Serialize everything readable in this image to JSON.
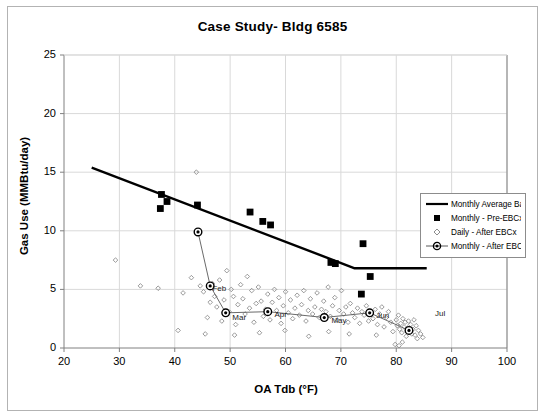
{
  "chart_data": {
    "type": "scatter",
    "title": "Case Study- Bldg 6585",
    "xlabel": "OA Tdb (°F)",
    "ylabel": "Gas Use (MMBtu/day)",
    "xlim": [
      20,
      100
    ],
    "ylim": [
      0,
      25
    ],
    "xticks": [
      20,
      30,
      40,
      50,
      60,
      70,
      80,
      90,
      100
    ],
    "yticks": [
      0,
      5,
      10,
      15,
      20,
      25
    ],
    "grid": "both-light",
    "legend_position": "right-middle",
    "series": [
      {
        "name": "Monthly Average Baseline",
        "type": "line",
        "marker": "none",
        "color": "#000000",
        "points": [
          [
            25.0,
            15.4
          ],
          [
            72.5,
            6.8
          ],
          [
            85.5,
            6.8
          ]
        ]
      },
      {
        "name": "Monthly - Pre-EBCx",
        "type": "scatter",
        "marker": "filled-square",
        "color": "#000000",
        "points": [
          [
            37.6,
            13.1
          ],
          [
            38.6,
            12.5
          ],
          [
            37.4,
            11.9
          ],
          [
            44.1,
            12.2
          ],
          [
            53.6,
            11.6
          ],
          [
            55.9,
            10.8
          ],
          [
            57.3,
            10.5
          ],
          [
            68.2,
            7.3
          ],
          [
            69.0,
            7.2
          ],
          [
            74.0,
            8.9
          ],
          [
            75.3,
            6.1
          ],
          [
            73.7,
            4.6
          ]
        ]
      },
      {
        "name": "Daily - After EBCx",
        "type": "scatter",
        "marker": "open-diamond",
        "color": "#808080",
        "points": [
          [
            29.3,
            7.5
          ],
          [
            33.8,
            5.3
          ],
          [
            37.0,
            5.1
          ],
          [
            40.6,
            1.5
          ],
          [
            41.5,
            4.7
          ],
          [
            43.9,
            15.0
          ],
          [
            44.2,
            9.9
          ],
          [
            43.0,
            6.0
          ],
          [
            44.6,
            5.3
          ],
          [
            45.2,
            4.8
          ],
          [
            45.9,
            2.6
          ],
          [
            46.4,
            3.9
          ],
          [
            46.8,
            5.5
          ],
          [
            47.2,
            4.4
          ],
          [
            47.6,
            3.5
          ],
          [
            48.1,
            5.8
          ],
          [
            48.5,
            2.3
          ],
          [
            48.9,
            4.1
          ],
          [
            49.4,
            6.6
          ],
          [
            49.8,
            3.1
          ],
          [
            50.2,
            5.0
          ],
          [
            50.6,
            4.4
          ],
          [
            51.0,
            2.0
          ],
          [
            51.4,
            3.7
          ],
          [
            51.9,
            5.4
          ],
          [
            52.3,
            4.2
          ],
          [
            52.7,
            2.9
          ],
          [
            53.1,
            6.1
          ],
          [
            53.5,
            3.4
          ],
          [
            53.9,
            4.9
          ],
          [
            54.3,
            2.2
          ],
          [
            54.7,
            3.8
          ],
          [
            55.1,
            5.2
          ],
          [
            55.6,
            4.0
          ],
          [
            56.0,
            2.7
          ],
          [
            56.4,
            3.3
          ],
          [
            56.8,
            4.6
          ],
          [
            57.2,
            2.4
          ],
          [
            57.6,
            3.9
          ],
          [
            58.0,
            5.0
          ],
          [
            58.4,
            3.2
          ],
          [
            58.8,
            4.3
          ],
          [
            59.2,
            2.1
          ],
          [
            59.6,
            3.6
          ],
          [
            60.0,
            4.8
          ],
          [
            60.5,
            3.0
          ],
          [
            60.9,
            4.1
          ],
          [
            61.3,
            2.5
          ],
          [
            61.7,
            3.4
          ],
          [
            62.1,
            4.5
          ],
          [
            62.5,
            2.8
          ],
          [
            62.9,
            3.7
          ],
          [
            63.3,
            4.9
          ],
          [
            63.7,
            2.3
          ],
          [
            64.1,
            3.2
          ],
          [
            64.5,
            4.2
          ],
          [
            64.9,
            2.9
          ],
          [
            65.3,
            3.5
          ],
          [
            65.7,
            4.7
          ],
          [
            66.1,
            2.6
          ],
          [
            66.5,
            3.3
          ],
          [
            66.9,
            4.0
          ],
          [
            67.3,
            3.1
          ],
          [
            67.7,
            5.2
          ],
          [
            68.1,
            2.7
          ],
          [
            68.5,
            3.6
          ],
          [
            68.9,
            4.3
          ],
          [
            69.3,
            2.4
          ],
          [
            69.7,
            3.2
          ],
          [
            70.1,
            4.9
          ],
          [
            70.5,
            2.9
          ],
          [
            70.9,
            3.5
          ],
          [
            71.3,
            2.2
          ],
          [
            71.7,
            3.8
          ],
          [
            72.1,
            3.0
          ],
          [
            72.5,
            2.6
          ],
          [
            73.0,
            3.4
          ],
          [
            73.4,
            2.1
          ],
          [
            73.8,
            3.1
          ],
          [
            74.2,
            2.8
          ],
          [
            74.6,
            3.6
          ],
          [
            75.0,
            2.3
          ],
          [
            75.4,
            3.0
          ],
          [
            75.8,
            2.5
          ],
          [
            76.2,
            3.3
          ],
          [
            76.6,
            2.0
          ],
          [
            77.0,
            2.9
          ],
          [
            77.4,
            3.5
          ],
          [
            77.8,
            1.8
          ],
          [
            78.2,
            2.6
          ],
          [
            78.6,
            3.1
          ],
          [
            79.0,
            2.2
          ],
          [
            79.4,
            1.4
          ],
          [
            79.8,
            0.3
          ],
          [
            80.0,
            2.4
          ],
          [
            80.2,
            1.9
          ],
          [
            80.4,
            2.8
          ],
          [
            80.6,
            1.6
          ],
          [
            80.8,
            2.1
          ],
          [
            81.0,
            1.3
          ],
          [
            81.2,
            2.5
          ],
          [
            81.4,
            1.8
          ],
          [
            81.6,
            2.2
          ],
          [
            81.8,
            1.0
          ],
          [
            82.0,
            1.7
          ],
          [
            82.2,
            2.3
          ],
          [
            82.4,
            1.4
          ],
          [
            82.6,
            2.0
          ],
          [
            82.8,
            1.2
          ],
          [
            83.0,
            1.6
          ],
          [
            83.2,
            2.4
          ],
          [
            83.4,
            1.1
          ],
          [
            83.6,
            1.9
          ],
          [
            83.8,
            0.8
          ],
          [
            84.0,
            1.5
          ],
          [
            84.4,
            1.2
          ],
          [
            84.8,
            0.9
          ],
          [
            80.5,
            0.2
          ],
          [
            81.1,
            0.5
          ],
          [
            45.5,
            1.2
          ],
          [
            50.8,
            1.1
          ],
          [
            55.3,
            1.3
          ],
          [
            59.9,
            1.5
          ],
          [
            64.2,
            1.0
          ],
          [
            67.8,
            1.4
          ],
          [
            71.5,
            1.2
          ],
          [
            76.4,
            1.1
          ]
        ]
      },
      {
        "name": "Monthly - After EBCx",
        "type": "line-marker",
        "marker": "bullseye-circle",
        "color": "#595959",
        "points": [
          [
            44.2,
            9.9
          ],
          [
            46.4,
            5.3
          ],
          [
            49.2,
            3.0
          ],
          [
            56.8,
            3.1
          ],
          [
            67.0,
            2.6
          ],
          [
            75.2,
            3.0
          ],
          [
            82.3,
            1.5
          ]
        ],
        "point_labels": [
          "",
          "Feb",
          "Mar",
          "Apr",
          "May",
          "Jun",
          "Jul"
        ]
      }
    ],
    "annotations": [
      {
        "text": "Feb",
        "x": 46.8,
        "y": 5.0
      },
      {
        "text": "Mar",
        "x": 50.4,
        "y": 2.6
      },
      {
        "text": "Apr",
        "x": 58.0,
        "y": 2.8
      },
      {
        "text": "May",
        "x": 68.3,
        "y": 2.3
      },
      {
        "text": "Jun",
        "x": 76.4,
        "y": 2.7
      },
      {
        "text": "Jul",
        "x": 87.0,
        "y": 2.9
      }
    ]
  },
  "legend": {
    "items": [
      {
        "label": "Monthly Average Baseline",
        "key": "line"
      },
      {
        "label": "Monthly - Pre-EBCx",
        "key": "filled-square"
      },
      {
        "label": "Daily - After EBCx",
        "key": "open-diamond"
      },
      {
        "label": "Monthly - After EBCx",
        "key": "line-bullseye"
      }
    ]
  },
  "colors": {
    "axis": "#808080",
    "grid": "#d9d9d9",
    "baseline": "#000000",
    "pre_ebcx": "#000000",
    "daily_after": "#808080",
    "monthly_after": "#595959",
    "border": "#b3b3b3"
  }
}
